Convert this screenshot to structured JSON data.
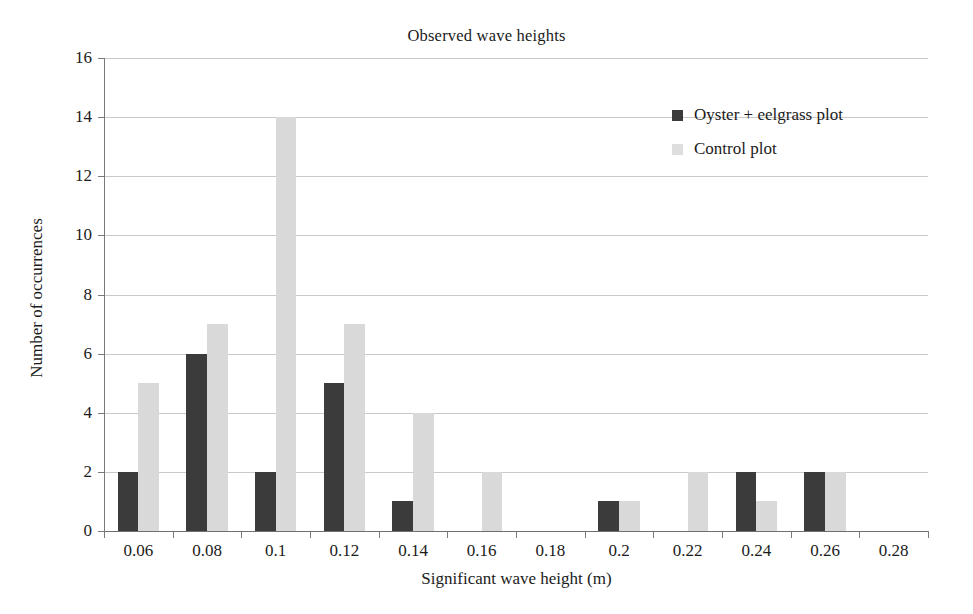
{
  "chart_data": {
    "type": "bar",
    "title": "Observed wave heights",
    "xlabel": "Significant wave height (m)",
    "ylabel": "Number of occurrences",
    "categories": [
      "0.06",
      "0.08",
      "0.1",
      "0.12",
      "0.14",
      "0.16",
      "0.18",
      "0.2",
      "0.22",
      "0.24",
      "0.26",
      "0.28"
    ],
    "series": [
      {
        "name": "Oyster + eelgrass plot",
        "color": "#3b3b3b",
        "values": [
          2,
          6,
          2,
          5,
          1,
          0,
          0,
          1,
          0,
          2,
          2,
          0
        ]
      },
      {
        "name": "Control plot",
        "color": "#d9d9d9",
        "values": [
          5,
          7,
          14,
          7,
          4,
          2,
          0,
          1,
          2,
          1,
          2,
          0
        ]
      }
    ],
    "ylim": [
      0,
      16
    ],
    "ytick_labels": [
      "0",
      "2",
      "4",
      "6",
      "8",
      "10",
      "12",
      "14",
      "16"
    ],
    "yticks": [
      0,
      2,
      4,
      6,
      8,
      10,
      12,
      14,
      16
    ],
    "grid": "horizontal",
    "legend_position": "inside-top-right",
    "background_color": "#ffffff",
    "gridline_color": "#c9c9c9",
    "axis_color": "#7a7a7a"
  },
  "legend": {
    "items": [
      {
        "label": "Oyster + eelgrass plot",
        "swatch": "legend-swatch-oyster"
      },
      {
        "label": "Control plot",
        "swatch": "legend-swatch-control"
      }
    ]
  }
}
